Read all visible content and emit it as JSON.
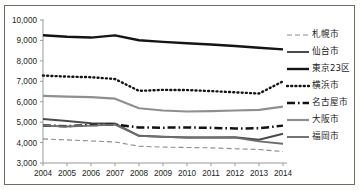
{
  "chart_data": {
    "type": "line",
    "title": "",
    "xlabel": "",
    "ylabel": "",
    "x": [
      2004,
      2005,
      2006,
      2007,
      2008,
      2009,
      2010,
      2011,
      2012,
      2013,
      2014
    ],
    "categories": [
      "2004",
      "2005",
      "2006",
      "2007",
      "2008",
      "2009",
      "2010",
      "2011",
      "2012",
      "2013",
      "2014"
    ],
    "ylim": [
      3000,
      10000
    ],
    "yticks": [
      3000,
      4000,
      5000,
      6000,
      7000,
      8000,
      9000,
      10000
    ],
    "ytick_labels": [
      "3,000",
      "4,000",
      "5,000",
      "6,000",
      "7,000",
      "8,000",
      "9,000",
      "10,000"
    ],
    "grid": false,
    "legend_position": "right",
    "series": [
      {
        "name": "札幌市",
        "style": "dashed",
        "color": "#8c8c8c",
        "width": 1.1,
        "dash": "5,3",
        "values": [
          4180,
          4130,
          4080,
          4030,
          3820,
          3780,
          3760,
          3740,
          3700,
          3660,
          3560
        ]
      },
      {
        "name": "仙台市",
        "style": "solid",
        "color": "#4a4a4a",
        "width": 2.0,
        "dash": "",
        "values": [
          5150,
          5050,
          4950,
          4930,
          4330,
          4280,
          4250,
          4250,
          4260,
          4140,
          4430
        ]
      },
      {
        "name": "東京23区",
        "style": "solid",
        "color": "#141414",
        "width": 2.4,
        "dash": "",
        "values": [
          9250,
          9180,
          9140,
          9250,
          9010,
          8930,
          8860,
          8800,
          8730,
          8640,
          8560
        ]
      },
      {
        "name": "横浜市",
        "style": "dotted",
        "color": "#141414",
        "width": 2.4,
        "dash": "1,3.2",
        "values": [
          7280,
          7230,
          7200,
          7110,
          6530,
          6580,
          6570,
          6520,
          6460,
          6400,
          7000
        ]
      },
      {
        "name": "名古屋市",
        "style": "dash-dot",
        "color": "#121212",
        "width": 2.5,
        "dash": "8,3,1.6,3",
        "values": [
          4840,
          4800,
          4860,
          4880,
          4740,
          4730,
          4740,
          4720,
          4690,
          4700,
          4830
        ]
      },
      {
        "name": "大阪市",
        "style": "solid",
        "color": "#8f8f8f",
        "width": 2.2,
        "dash": "",
        "values": [
          6290,
          6250,
          6220,
          6150,
          5680,
          5570,
          5520,
          5540,
          5570,
          5600,
          5760
        ]
      },
      {
        "name": "福岡市",
        "style": "solid-light",
        "color": "#6e6e6e",
        "width": 1.9,
        "dash": "",
        "values": [
          4830,
          4790,
          4830,
          4880,
          4330,
          4280,
          4250,
          4250,
          4240,
          4060,
          3940
        ]
      }
    ]
  },
  "legend": {
    "items": [
      {
        "label": "札幌市",
        "swatch": "dashed-light"
      },
      {
        "label": "仙台市",
        "swatch": "solid-dark"
      },
      {
        "label": "東京23区",
        "swatch": "solid-black-thick"
      },
      {
        "label": "横浜市",
        "swatch": "dotted-black"
      },
      {
        "label": "名古屋市",
        "swatch": "dash-dot-black"
      },
      {
        "label": "大阪市",
        "swatch": "solid-gray"
      },
      {
        "label": "福岡市",
        "swatch": "solid-gray-dash"
      }
    ]
  },
  "axes": {
    "y_labels": [
      "10,000",
      "9,000",
      "8,000",
      "7,000",
      "6,000",
      "5,000",
      "4,000",
      "3,000"
    ],
    "x_labels": [
      "2004",
      "2005",
      "2006",
      "2007",
      "2008",
      "2009",
      "2010",
      "2011",
      "2012",
      "2013",
      "2014"
    ]
  }
}
